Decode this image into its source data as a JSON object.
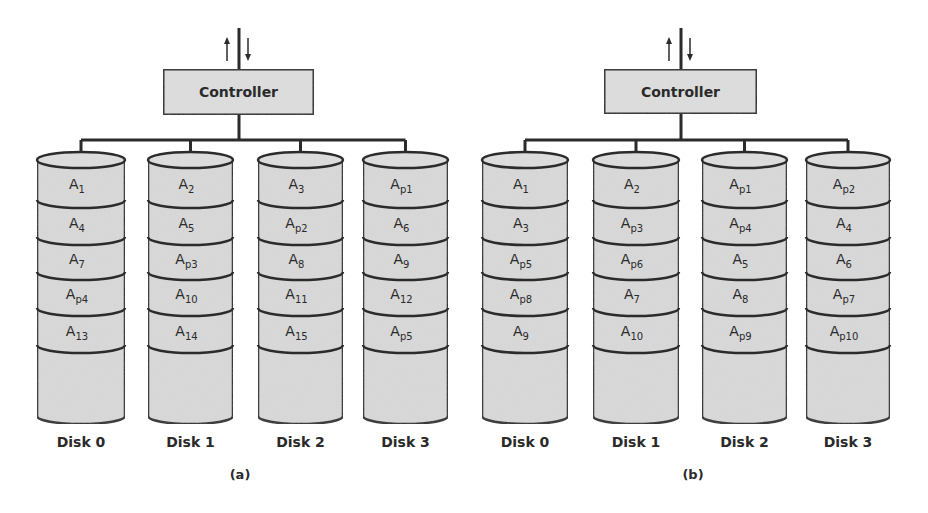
{
  "colors": {
    "fill": "#d9d9d9",
    "stroke": "#2b2b2b",
    "text": "#2a2a2a",
    "background": "#ffffff"
  },
  "panels": [
    {
      "caption": "(a)",
      "controller": {
        "label": "Controller",
        "arrows": [
          "up-arrow",
          "down-arrow"
        ]
      },
      "disks": [
        {
          "label": "Disk 0",
          "blocks": [
            [
              "A",
              "1"
            ],
            [
              "A",
              "4"
            ],
            [
              "A",
              "7"
            ],
            [
              "A",
              "p4"
            ],
            [
              "A",
              "13"
            ]
          ]
        },
        {
          "label": "Disk 1",
          "blocks": [
            [
              "A",
              "2"
            ],
            [
              "A",
              "5"
            ],
            [
              "A",
              "p3"
            ],
            [
              "A",
              "10"
            ],
            [
              "A",
              "14"
            ]
          ]
        },
        {
          "label": "Disk 2",
          "blocks": [
            [
              "A",
              "3"
            ],
            [
              "A",
              "p2"
            ],
            [
              "A",
              "8"
            ],
            [
              "A",
              "11"
            ],
            [
              "A",
              "15"
            ]
          ]
        },
        {
          "label": "Disk 3",
          "blocks": [
            [
              "A",
              "p1"
            ],
            [
              "A",
              "6"
            ],
            [
              "A",
              "9"
            ],
            [
              "A",
              "12"
            ],
            [
              "A",
              "p5"
            ]
          ]
        }
      ]
    },
    {
      "caption": "(b)",
      "controller": {
        "label": "Controller",
        "arrows": [
          "up-arrow",
          "down-arrow"
        ]
      },
      "disks": [
        {
          "label": "Disk 0",
          "blocks": [
            [
              "A",
              "1"
            ],
            [
              "A",
              "3"
            ],
            [
              "A",
              "p5"
            ],
            [
              "A",
              "p8"
            ],
            [
              "A",
              "9"
            ]
          ]
        },
        {
          "label": "Disk 1",
          "blocks": [
            [
              "A",
              "2"
            ],
            [
              "A",
              "p3"
            ],
            [
              "A",
              "p6"
            ],
            [
              "A",
              "7"
            ],
            [
              "A",
              "10"
            ]
          ]
        },
        {
          "label": "Disk 2",
          "blocks": [
            [
              "A",
              "p1"
            ],
            [
              "A",
              "p4"
            ],
            [
              "A",
              "5"
            ],
            [
              "A",
              "8"
            ],
            [
              "A",
              "p9"
            ]
          ]
        },
        {
          "label": "Disk 3",
          "blocks": [
            [
              "A",
              "p2"
            ],
            [
              "A",
              "4"
            ],
            [
              "A",
              "6"
            ],
            [
              "A",
              "p7"
            ],
            [
              "A",
              "p10"
            ]
          ]
        }
      ]
    }
  ]
}
